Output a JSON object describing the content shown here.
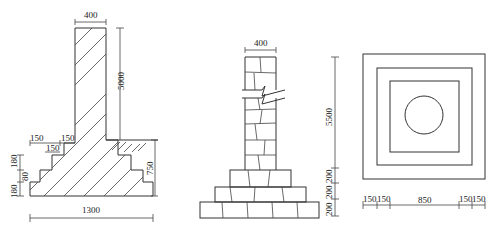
{
  "figure": {
    "left_section": {
      "name": "stepped-foundation-section",
      "dims": {
        "top_width": "400",
        "column_height": "5000",
        "step_widths": [
          "150",
          "150",
          "150"
        ],
        "step_heights": [
          "180",
          "80",
          "180"
        ],
        "ground_depth": "750",
        "base_width": "1300"
      }
    },
    "middle_section": {
      "name": "rubble-masonry-column-section",
      "dims": {
        "top_width": "400"
      }
    },
    "right_plan": {
      "name": "foundation-plan-view",
      "dims": {
        "vertical": [
          "5500",
          "200",
          "200",
          "200"
        ],
        "horizontal": [
          "150",
          "150",
          "850",
          "150",
          "150"
        ]
      }
    }
  }
}
